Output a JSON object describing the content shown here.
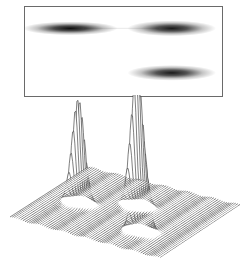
{
  "figure": {
    "top_panel": {
      "kind": "2d-separation-image",
      "spots": [
        {
          "label": "spot-1",
          "x_frac": 0.23,
          "y_frac": 0.24,
          "intensity": 0.95,
          "spread_x": 0.08,
          "spread_y": 0.035
        },
        {
          "label": "spot-2",
          "x_frac": 0.745,
          "y_frac": 0.24,
          "intensity": 0.9,
          "spread_x": 0.075,
          "spread_y": 0.04
        },
        {
          "label": "spot-3",
          "x_frac": 0.745,
          "y_frac": 0.74,
          "intensity": 0.9,
          "spread_x": 0.075,
          "spread_y": 0.04
        }
      ],
      "streak": {
        "from_x_frac": 0.3,
        "to_x_frac": 0.68,
        "y_frac": 0.24,
        "intensity": 0.08
      }
    },
    "bottom_panel": {
      "kind": "3d-wireframe-surface",
      "peaks": [
        {
          "label": "peak-1",
          "u": 0.22,
          "v": 0.45,
          "height": 0.78,
          "width": 0.05
        },
        {
          "label": "peak-2",
          "u": 0.52,
          "v": 0.62,
          "height": 1.0,
          "width": 0.05
        },
        {
          "label": "peak-3",
          "u": 0.72,
          "v": 0.28,
          "height": 0.82,
          "width": 0.05
        }
      ],
      "line_color": "#2a2a2a",
      "fill_color": "#ffffff"
    }
  }
}
